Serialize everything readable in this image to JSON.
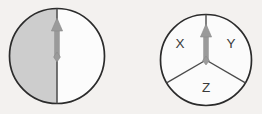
{
  "figure": {
    "name": "two-domain-magnetization-diagram",
    "background_color": "#f3f1ef",
    "width": 262,
    "height": 114
  },
  "colors": {
    "outline": "#2b2b2b",
    "shaded_half": "#cdcdcd",
    "unshaded_half": "#fcfcfc",
    "sector_fill": "#fbfbfb",
    "divider_line": "#4a4a4a",
    "sector_line": "#4a4a4a",
    "arrow": "#9a9a9a",
    "arrow_edge": "#8a8a8a",
    "label_text": "#3a3a3a"
  },
  "left_circle": {
    "name": "half-shaded-circle",
    "center_x": 57,
    "center_y": 56,
    "radius": 48,
    "halves": [
      {
        "name": "left-half",
        "label": "",
        "fill": "#cdcdcd"
      },
      {
        "name": "right-half",
        "label": "",
        "fill": "#fcfcfc"
      }
    ],
    "arrow": {
      "name": "up-arrow",
      "direction": "up",
      "tip_y": 18,
      "tail_y": 57
    },
    "divider": {
      "name": "vertical-divider",
      "top_y": 8,
      "bottom_y": 104
    }
  },
  "right_circle": {
    "name": "three-sector-circle",
    "center_x": 206,
    "center_y": 60,
    "radius": 46,
    "sectors": [
      {
        "name": "sector-x",
        "label": "X",
        "label_x": 180,
        "label_y": 44
      },
      {
        "name": "sector-y",
        "label": "Y",
        "label_x": 231,
        "label_y": 44
      },
      {
        "name": "sector-z",
        "label": "Z",
        "label_x": 206,
        "label_y": 88
      }
    ],
    "arrow": {
      "name": "up-arrow",
      "direction": "up",
      "tip_y": 24,
      "tail_y": 61
    },
    "boundaries": [
      {
        "name": "boundary-up",
        "angle_deg": 90
      },
      {
        "name": "boundary-lower-left",
        "angle_deg": 210
      },
      {
        "name": "boundary-lower-right",
        "angle_deg": 330
      }
    ]
  }
}
